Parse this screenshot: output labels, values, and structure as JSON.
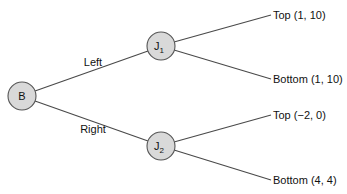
{
  "tree": {
    "root": {
      "id": "B",
      "label": "B",
      "subscript": ""
    },
    "branches": [
      {
        "action": "Left",
        "node": {
          "id": "J1",
          "label": "J",
          "subscript": "1"
        },
        "outcomes": [
          {
            "action": "Top",
            "payoff": "(1, 10)",
            "text": "Top (1, 10)"
          },
          {
            "action": "Bottom",
            "payoff": "(1, 10)",
            "text": "Bottom (1, 10)"
          }
        ]
      },
      {
        "action": "Right",
        "node": {
          "id": "J2",
          "label": "J",
          "subscript": "2"
        },
        "outcomes": [
          {
            "action": "Top",
            "payoff": "(−2, 0)",
            "text": "Top (−2, 0)"
          },
          {
            "action": "Bottom",
            "payoff": "(4, 4)",
            "text": "Bottom (4, 4)"
          }
        ]
      }
    ]
  },
  "colors": {
    "node_fill": "#d9d9d9",
    "node_stroke": "#555555",
    "edge": "#4a4a4a",
    "text": "#111111"
  }
}
